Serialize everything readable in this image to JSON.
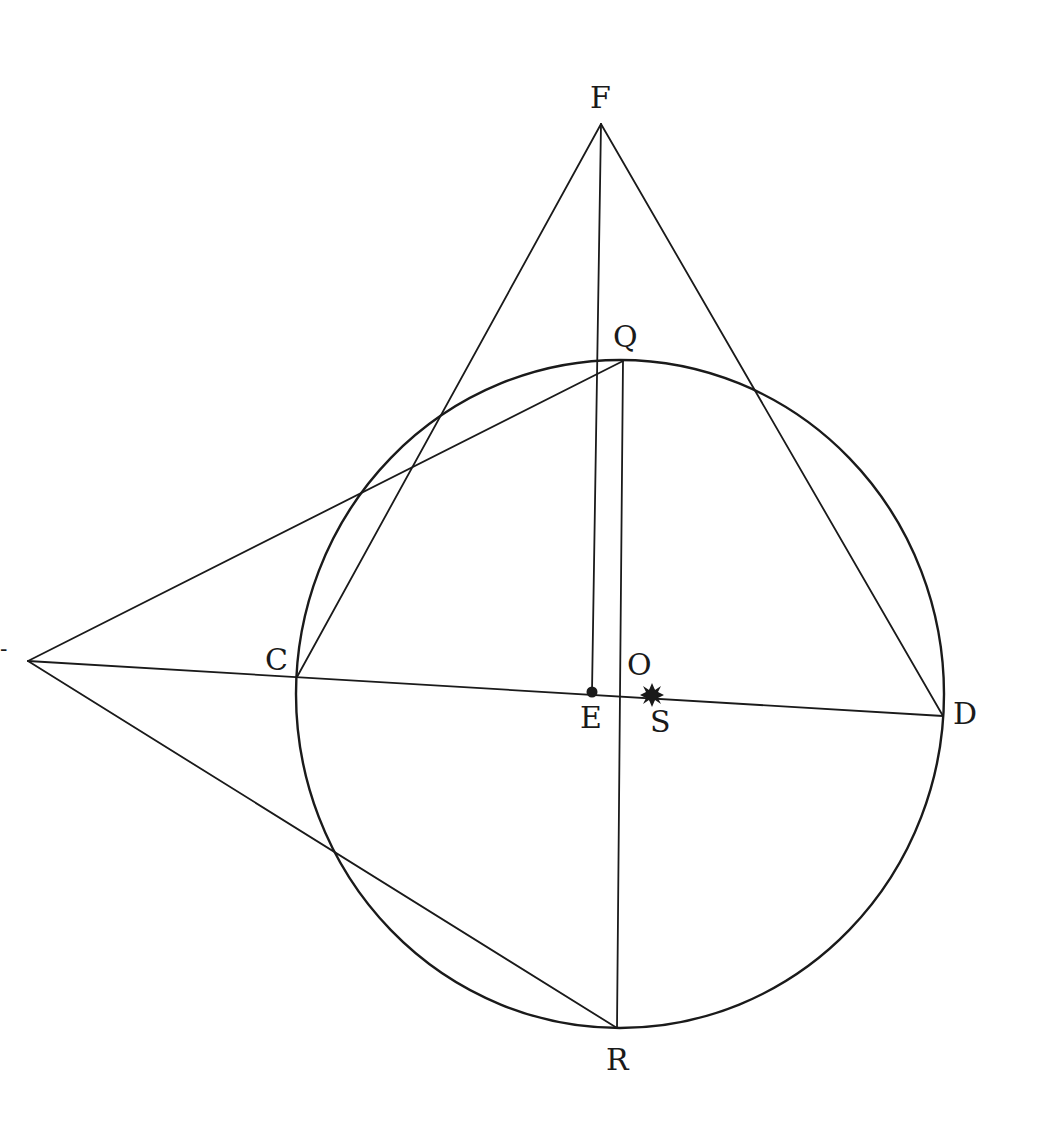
{
  "diagram": {
    "colors": {
      "background": "#ffffff",
      "ink": "#1a1a1a"
    },
    "circle": {
      "center_label": "O",
      "cx": 620,
      "cy": 694,
      "rx": 324,
      "ry": 334
    },
    "points": {
      "F": {
        "label": "F",
        "x": 601,
        "y": 124
      },
      "Q": {
        "label": "Q",
        "x": 623,
        "y": 361
      },
      "C": {
        "label": "C",
        "x": 297,
        "y": 677
      },
      "D": {
        "label": "D",
        "x": 943,
        "y": 716
      },
      "R": {
        "label": "R",
        "x": 617,
        "y": 1028
      },
      "E": {
        "label": "E",
        "x": 592,
        "y": 692
      },
      "S": {
        "label": "S",
        "x": 652,
        "y": 695
      },
      "T": {
        "label": "-",
        "x": 28,
        "y": 661
      }
    },
    "labels": {
      "F": "F",
      "Q": "Q",
      "C": "C",
      "O": "O",
      "E": "E",
      "S": "S",
      "D": "D",
      "R": "R",
      "T_fragment": "-"
    },
    "segments": [
      {
        "from": "F",
        "to": "C"
      },
      {
        "from": "F",
        "to": "D"
      },
      {
        "from": "F",
        "to": "E"
      },
      {
        "from": "Q",
        "to": "R"
      },
      {
        "from": "T",
        "to": "Q"
      },
      {
        "from": "T",
        "to": "R"
      },
      {
        "from": "T",
        "to": "D"
      }
    ],
    "markers": {
      "E": "filled-dot",
      "S": "star-sun"
    }
  }
}
